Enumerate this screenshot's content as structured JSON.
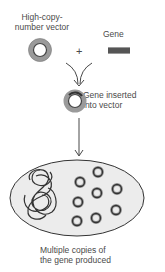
{
  "diagram": {
    "vector_label_line1": "High-copy-",
    "vector_label_line2": "number vector",
    "plus_sign": "+",
    "gene_label": "Gene",
    "inserted_label_line1": "Gene inserted",
    "inserted_label_line2": "into vector",
    "result_label_line1": "Multiple copies of",
    "result_label_line2": "the gene produced",
    "colors": {
      "ring_outer": "#8a8a8a",
      "ring_inner": "#444444",
      "gene_bar": "#555555",
      "cell_fill": "#ececec",
      "cell_stroke": "#333333",
      "arrow": "#333333"
    },
    "plasmid_copies_in_cell": 9
  }
}
